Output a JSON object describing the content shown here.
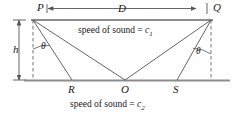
{
  "figure": {
    "colors": {
      "line": "#555555",
      "heavy_line": "#888888",
      "dashed": "#666666",
      "text": "#1a1a1a",
      "background": "#ffffff"
    },
    "points": [
      {
        "id": "P",
        "label": "P",
        "x": 33,
        "y": 20,
        "label_x": 37,
        "label_y": 2
      },
      {
        "id": "Q",
        "label": "Q",
        "x": 211,
        "y": 20,
        "label_x": 212,
        "label_y": 2
      },
      {
        "id": "R",
        "label": "R",
        "x": 72,
        "y": 80,
        "label_x": 68,
        "label_y": 84
      },
      {
        "id": "O",
        "label": "O",
        "x": 125,
        "y": 80,
        "label_x": 121,
        "label_y": 84
      },
      {
        "id": "S",
        "label": "S",
        "x": 177,
        "y": 80,
        "label_x": 173,
        "label_y": 84
      }
    ],
    "dimensions": [
      {
        "id": "D",
        "label": "D",
        "orientation": "horizontal",
        "label_x": 118,
        "label_y": 3
      },
      {
        "id": "h",
        "label": "h",
        "orientation": "vertical",
        "label_x": 14,
        "label_y": 44
      }
    ],
    "angles": [
      {
        "id": "theta-left",
        "label": "θ",
        "label_x": 41,
        "label_y": 42
      },
      {
        "id": "theta-right",
        "label": "θ",
        "label_x": 196,
        "label_y": 47
      }
    ],
    "captions": [
      {
        "id": "upper-medium",
        "text_prefix": "speed of sound = ",
        "variable": "c",
        "subscript": "1",
        "x": 78,
        "y": 26
      },
      {
        "id": "lower-medium",
        "text_prefix": "speed of sound = ",
        "variable": "c",
        "subscript": "2",
        "x": 70,
        "y": 100
      }
    ]
  }
}
